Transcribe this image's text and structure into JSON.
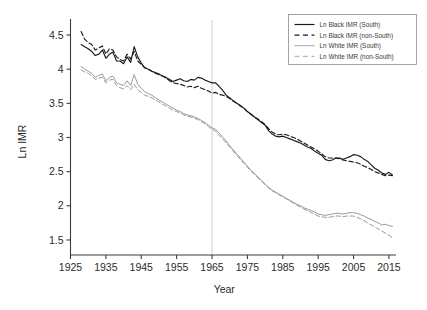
{
  "chart_data": {
    "type": "line",
    "title": "",
    "xlabel": "Year",
    "ylabel": "Ln IMR",
    "xlim": [
      1925,
      2017
    ],
    "ylim": [
      1.28,
      4.72
    ],
    "xticks": [
      1925,
      1935,
      1945,
      1955,
      1965,
      1975,
      1985,
      1995,
      2005,
      2015
    ],
    "xtick_labels": [
      "1925",
      "1935",
      "1945",
      "1955",
      "1965",
      "1975",
      "1985",
      "1995",
      "2005",
      "2015"
    ],
    "yticks": [
      1.5,
      2,
      2.5,
      3,
      3.5,
      4,
      4.5
    ],
    "ytick_labels": [
      "1.5",
      "2",
      "2.5",
      "3",
      "3.5",
      "4",
      "4.5"
    ],
    "grid": false,
    "legend_position": "top-right",
    "annotations": [
      {
        "name": "vertical-reference-line",
        "type": "vline",
        "x": 1965,
        "color": "#cfcfcf"
      }
    ],
    "series": [
      {
        "name": "Ln Black IMR (South)",
        "color": "#1a1a1a",
        "style": "solid",
        "width": 1.15,
        "x": [
          1928,
          1929,
          1930,
          1931,
          1932,
          1933,
          1934,
          1935,
          1936,
          1937,
          1938,
          1939,
          1940,
          1941,
          1942,
          1943,
          1944,
          1945,
          1946,
          1947,
          1948,
          1949,
          1950,
          1951,
          1952,
          1953,
          1954,
          1955,
          1956,
          1957,
          1958,
          1959,
          1960,
          1961,
          1962,
          1963,
          1964,
          1965,
          1966,
          1967,
          1968,
          1969,
          1970,
          1971,
          1972,
          1973,
          1974,
          1975,
          1976,
          1977,
          1978,
          1979,
          1980,
          1981,
          1982,
          1983,
          1984,
          1985,
          1986,
          1987,
          1988,
          1989,
          1990,
          1991,
          1992,
          1993,
          1994,
          1995,
          1996,
          1997,
          1998,
          1999,
          2000,
          2001,
          2002,
          2003,
          2004,
          2005,
          2006,
          2007,
          2008,
          2009,
          2010,
          2011,
          2012,
          2013,
          2014,
          2015,
          2016
        ],
        "y": [
          4.36,
          4.33,
          4.3,
          4.26,
          4.2,
          4.22,
          4.28,
          4.16,
          4.22,
          4.25,
          4.12,
          4.12,
          4.08,
          4.18,
          4.1,
          4.33,
          4.18,
          4.09,
          4.02,
          4.0,
          3.97,
          3.95,
          3.93,
          3.9,
          3.88,
          3.85,
          3.82,
          3.84,
          3.86,
          3.83,
          3.82,
          3.85,
          3.84,
          3.88,
          3.87,
          3.84,
          3.82,
          3.8,
          3.8,
          3.75,
          3.69,
          3.62,
          3.58,
          3.54,
          3.5,
          3.47,
          3.43,
          3.38,
          3.34,
          3.3,
          3.26,
          3.22,
          3.18,
          3.1,
          3.05,
          3.02,
          3.01,
          3.02,
          3.0,
          2.98,
          2.96,
          2.94,
          2.92,
          2.89,
          2.86,
          2.84,
          2.8,
          2.77,
          2.74,
          2.68,
          2.66,
          2.67,
          2.7,
          2.7,
          2.68,
          2.7,
          2.72,
          2.75,
          2.74,
          2.72,
          2.68,
          2.65,
          2.6,
          2.55,
          2.52,
          2.48,
          2.46,
          2.49,
          2.45
        ]
      },
      {
        "name": "Ln Black IMR (non-South)",
        "color": "#1a1a1a",
        "style": "dashed",
        "width": 1.15,
        "x": [
          1928,
          1929,
          1930,
          1931,
          1932,
          1933,
          1934,
          1935,
          1936,
          1937,
          1938,
          1939,
          1940,
          1941,
          1942,
          1943,
          1944,
          1945,
          1946,
          1947,
          1948,
          1949,
          1950,
          1951,
          1952,
          1953,
          1954,
          1955,
          1956,
          1957,
          1958,
          1959,
          1960,
          1961,
          1962,
          1963,
          1964,
          1965,
          1966,
          1967,
          1968,
          1969,
          1970,
          1971,
          1972,
          1973,
          1974,
          1975,
          1976,
          1977,
          1978,
          1979,
          1980,
          1981,
          1982,
          1983,
          1984,
          1985,
          1986,
          1987,
          1988,
          1989,
          1990,
          1991,
          1992,
          1993,
          1994,
          1995,
          1996,
          1997,
          1998,
          1999,
          2000,
          2001,
          2002,
          2003,
          2004,
          2005,
          2006,
          2007,
          2008,
          2009,
          2010,
          2011,
          2012,
          2013,
          2014,
          2015,
          2016
        ],
        "y": [
          4.55,
          4.44,
          4.39,
          4.36,
          4.28,
          4.31,
          4.34,
          4.22,
          4.3,
          4.28,
          4.18,
          4.14,
          4.12,
          4.22,
          4.15,
          4.26,
          4.12,
          4.07,
          4.02,
          4.0,
          3.97,
          3.94,
          3.92,
          3.9,
          3.87,
          3.83,
          3.8,
          3.79,
          3.78,
          3.76,
          3.74,
          3.75,
          3.73,
          3.75,
          3.72,
          3.7,
          3.68,
          3.65,
          3.66,
          3.63,
          3.62,
          3.6,
          3.57,
          3.53,
          3.5,
          3.46,
          3.43,
          3.38,
          3.34,
          3.3,
          3.27,
          3.23,
          3.19,
          3.13,
          3.08,
          3.05,
          3.04,
          3.05,
          3.04,
          3.02,
          3.0,
          2.98,
          2.95,
          2.92,
          2.89,
          2.86,
          2.83,
          2.8,
          2.76,
          2.72,
          2.7,
          2.7,
          2.7,
          2.69,
          2.67,
          2.66,
          2.65,
          2.64,
          2.63,
          2.61,
          2.58,
          2.56,
          2.53,
          2.5,
          2.48,
          2.46,
          2.44,
          2.45,
          2.44
        ]
      },
      {
        "name": "Ln White IMR (South)",
        "color": "#9a9a9a",
        "style": "solid",
        "width": 1.0,
        "x": [
          1928,
          1929,
          1930,
          1931,
          1932,
          1933,
          1934,
          1935,
          1936,
          1937,
          1938,
          1939,
          1940,
          1941,
          1942,
          1943,
          1944,
          1945,
          1946,
          1947,
          1948,
          1949,
          1950,
          1951,
          1952,
          1953,
          1954,
          1955,
          1956,
          1957,
          1958,
          1959,
          1960,
          1961,
          1962,
          1963,
          1964,
          1965,
          1966,
          1967,
          1968,
          1969,
          1970,
          1971,
          1972,
          1973,
          1974,
          1975,
          1976,
          1977,
          1978,
          1979,
          1980,
          1981,
          1982,
          1983,
          1984,
          1985,
          1986,
          1987,
          1988,
          1989,
          1990,
          1991,
          1992,
          1993,
          1994,
          1995,
          1996,
          1997,
          1998,
          1999,
          2000,
          2001,
          2002,
          2003,
          2004,
          2005,
          2006,
          2007,
          2008,
          2009,
          2010,
          2011,
          2012,
          2013,
          2014,
          2015,
          2016
        ],
        "y": [
          4.04,
          4.0,
          3.97,
          3.94,
          3.88,
          3.91,
          3.93,
          3.83,
          3.88,
          3.9,
          3.8,
          3.78,
          3.76,
          3.83,
          3.76,
          3.92,
          3.78,
          3.72,
          3.67,
          3.64,
          3.62,
          3.58,
          3.55,
          3.52,
          3.49,
          3.46,
          3.43,
          3.4,
          3.38,
          3.35,
          3.33,
          3.32,
          3.3,
          3.28,
          3.25,
          3.22,
          3.18,
          3.14,
          3.12,
          3.06,
          3.01,
          2.95,
          2.88,
          2.82,
          2.76,
          2.7,
          2.64,
          2.58,
          2.52,
          2.47,
          2.42,
          2.37,
          2.32,
          2.27,
          2.23,
          2.2,
          2.17,
          2.14,
          2.11,
          2.08,
          2.05,
          2.02,
          2.0,
          1.97,
          1.95,
          1.93,
          1.91,
          1.88,
          1.87,
          1.86,
          1.87,
          1.88,
          1.89,
          1.89,
          1.88,
          1.89,
          1.9,
          1.9,
          1.89,
          1.87,
          1.85,
          1.82,
          1.8,
          1.77,
          1.75,
          1.72,
          1.73,
          1.71,
          1.7
        ]
      },
      {
        "name": "Ln White IMR (non-South)",
        "color": "#9a9a9a",
        "style": "dashed",
        "width": 1.0,
        "x": [
          1928,
          1929,
          1930,
          1931,
          1932,
          1933,
          1934,
          1935,
          1936,
          1937,
          1938,
          1939,
          1940,
          1941,
          1942,
          1943,
          1944,
          1945,
          1946,
          1947,
          1948,
          1949,
          1950,
          1951,
          1952,
          1953,
          1954,
          1955,
          1956,
          1957,
          1958,
          1959,
          1960,
          1961,
          1962,
          1963,
          1964,
          1965,
          1966,
          1967,
          1968,
          1969,
          1970,
          1971,
          1972,
          1973,
          1974,
          1975,
          1976,
          1977,
          1978,
          1979,
          1980,
          1981,
          1982,
          1983,
          1984,
          1985,
          1986,
          1987,
          1988,
          1989,
          1990,
          1991,
          1992,
          1993,
          1994,
          1995,
          1996,
          1997,
          1998,
          1999,
          2000,
          2001,
          2002,
          2003,
          2004,
          2005,
          2006,
          2007,
          2008,
          2009,
          2010,
          2011,
          2012,
          2013,
          2014,
          2015,
          2016
        ],
        "y": [
          3.99,
          3.96,
          3.94,
          3.9,
          3.85,
          3.87,
          3.88,
          3.8,
          3.84,
          3.85,
          3.76,
          3.73,
          3.71,
          3.76,
          3.7,
          3.78,
          3.7,
          3.66,
          3.62,
          3.6,
          3.58,
          3.55,
          3.52,
          3.49,
          3.46,
          3.43,
          3.4,
          3.38,
          3.36,
          3.33,
          3.31,
          3.3,
          3.28,
          3.26,
          3.23,
          3.2,
          3.16,
          3.12,
          3.09,
          3.03,
          2.98,
          2.92,
          2.86,
          2.8,
          2.74,
          2.68,
          2.62,
          2.56,
          2.51,
          2.46,
          2.41,
          2.36,
          2.31,
          2.26,
          2.22,
          2.19,
          2.16,
          2.13,
          2.1,
          2.07,
          2.04,
          2.01,
          1.98,
          1.95,
          1.93,
          1.9,
          1.88,
          1.85,
          1.84,
          1.83,
          1.83,
          1.84,
          1.85,
          1.85,
          1.84,
          1.85,
          1.85,
          1.85,
          1.83,
          1.81,
          1.78,
          1.75,
          1.72,
          1.69,
          1.66,
          1.63,
          1.6,
          1.57,
          1.53
        ]
      }
    ]
  },
  "legend": {
    "entries": [
      {
        "label": "Ln Black IMR (South)",
        "color": "#1a1a1a",
        "style": "solid"
      },
      {
        "label": "Ln Black IMR (non-South)",
        "color": "#1a1a1a",
        "style": "dashed"
      },
      {
        "label": "Ln White IMR (South)",
        "color": "#9a9a9a",
        "style": "solid"
      },
      {
        "label": "Ln White IMR (non-South)",
        "color": "#9a9a9a",
        "style": "dashed"
      }
    ]
  }
}
